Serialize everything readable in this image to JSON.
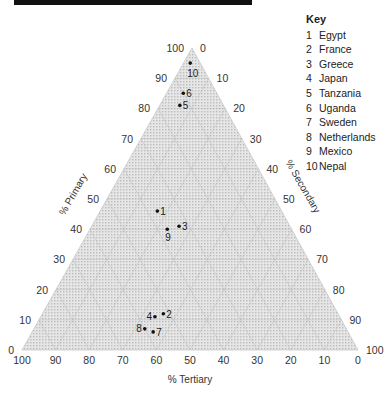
{
  "chart_data": {
    "type": "scatter",
    "subtype": "ternary",
    "title": "",
    "axes": {
      "primary": {
        "label": "% Primary",
        "ticks": [
          0,
          10,
          20,
          30,
          40,
          50,
          60,
          70,
          80,
          90,
          100
        ],
        "position": "left edge",
        "apex": "top"
      },
      "secondary": {
        "label": "% Secondary",
        "ticks": [
          0,
          10,
          20,
          30,
          40,
          50,
          60,
          70,
          80,
          90,
          100
        ],
        "position": "right edge",
        "apex": "bottom-right"
      },
      "tertiary": {
        "label": "% Tertiary",
        "ticks": [
          100,
          90,
          80,
          70,
          60,
          50,
          40,
          30,
          20,
          10,
          0
        ],
        "position": "bottom edge",
        "apex": "bottom-left"
      }
    },
    "grid": true,
    "legend_position": "top-right",
    "points": [
      {
        "id": 1,
        "name": "Egypt",
        "primary": 46,
        "secondary": 17,
        "tertiary": 37
      },
      {
        "id": 2,
        "name": "France",
        "primary": 12,
        "secondary": 36,
        "tertiary": 52
      },
      {
        "id": 3,
        "name": "Greece",
        "primary": 41,
        "secondary": 26,
        "tertiary": 33
      },
      {
        "id": 4,
        "name": "Japan",
        "primary": 11,
        "secondary": 34,
        "tertiary": 55
      },
      {
        "id": 5,
        "name": "Tanzania",
        "primary": 81,
        "secondary": 6,
        "tertiary": 13
      },
      {
        "id": 6,
        "name": "Uganda",
        "primary": 85,
        "secondary": 5,
        "tertiary": 10
      },
      {
        "id": 7,
        "name": "Sweden",
        "primary": 6,
        "secondary": 36,
        "tertiary": 58
      },
      {
        "id": 8,
        "name": "Netherlands",
        "primary": 7,
        "secondary": 33,
        "tertiary": 60
      },
      {
        "id": 9,
        "name": "Mexico",
        "primary": 40,
        "secondary": 23,
        "tertiary": 37
      },
      {
        "id": 10,
        "name": "Nepal",
        "primary": 95,
        "secondary": 2,
        "tertiary": 3
      }
    ]
  },
  "legend": {
    "title": "Key",
    "items": [
      {
        "num": "1",
        "label": "Egypt"
      },
      {
        "num": "2",
        "label": "France"
      },
      {
        "num": "3",
        "label": "Greece"
      },
      {
        "num": "4",
        "label": "Japan"
      },
      {
        "num": "5",
        "label": "Tanzania"
      },
      {
        "num": "6",
        "label": "Uganda"
      },
      {
        "num": "7",
        "label": "Sweden"
      },
      {
        "num": "8",
        "label": "Netherlands"
      },
      {
        "num": "9",
        "label": "Mexico"
      },
      {
        "num": "10",
        "label": "Nepal"
      }
    ]
  },
  "colors": {
    "fill": "#d9d9d9",
    "grid": "#bdbdbd",
    "point": "#111111",
    "bar": "#111111"
  }
}
